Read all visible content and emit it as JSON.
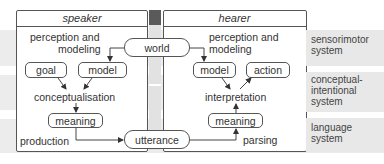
{
  "speaker": {
    "title": "speaker",
    "perception": "perception and",
    "modeling": "modeling",
    "goal": "goal",
    "model": "model",
    "conceptualisation": "conceptualisation",
    "meaning": "meaning",
    "production": "production"
  },
  "hearer": {
    "title": "hearer",
    "perception": "perception and",
    "modeling": "modeling",
    "model": "model",
    "action": "action",
    "interpretation": "interpretation",
    "meaning": "meaning",
    "parsing": "parsing"
  },
  "shared": {
    "world": "world",
    "utterance": "utterance"
  },
  "systems": [
    {
      "line1": "sensorimotor",
      "line2": "system",
      "line3": ""
    },
    {
      "line1": "conceptual-",
      "line2": "intentional",
      "line3": "system"
    },
    {
      "line1": "language",
      "line2": "system",
      "line3": ""
    }
  ]
}
